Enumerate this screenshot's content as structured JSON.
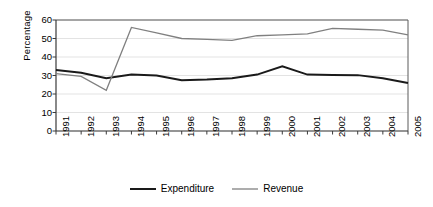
{
  "chart_data": {
    "type": "line",
    "title": "",
    "xlabel": "",
    "ylabel": "Percentage",
    "ylim": [
      0,
      60
    ],
    "yticks": [
      0,
      10,
      20,
      30,
      40,
      50,
      60
    ],
    "grid": true,
    "grid_axis": "y",
    "legend_position": "bottom",
    "categories": [
      "1991",
      "1992",
      "1993",
      "1994",
      "1995",
      "1996",
      "1997",
      "1998",
      "1999",
      "2000",
      "2001",
      "2002",
      "2003",
      "2004",
      "2005"
    ],
    "series": [
      {
        "name": "Expenditure",
        "color": "#1a1a1a",
        "line_width": 2.0,
        "values": [
          33,
          31.5,
          28.5,
          30.5,
          30,
          27.5,
          27.8,
          28.5,
          30.5,
          35,
          30.5,
          30.3,
          30.2,
          28.5,
          26
        ]
      },
      {
        "name": "Revenue",
        "color": "#808080",
        "line_width": 1.3,
        "values": [
          31,
          29.5,
          22,
          56,
          53,
          50,
          49.5,
          49,
          51.5,
          52,
          52.5,
          55.5,
          55,
          54.5,
          52
        ]
      }
    ]
  },
  "axes": {
    "ylabel": "Percentage"
  },
  "legend": {
    "items": [
      {
        "label": "Expenditure"
      },
      {
        "label": "Revenue"
      }
    ]
  }
}
